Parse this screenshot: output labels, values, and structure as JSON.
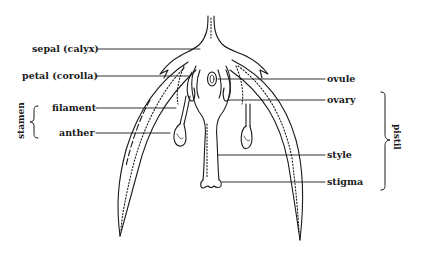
{
  "diagram": {
    "labels_left": [
      {
        "id": "sepal",
        "text": "sepal (calyx)"
      },
      {
        "id": "petal",
        "text": "petal (corolla)"
      },
      {
        "id": "filament",
        "text": "filament"
      },
      {
        "id": "anther",
        "text": "anther"
      }
    ],
    "labels_right": [
      {
        "id": "ovule",
        "text": "ovule"
      },
      {
        "id": "ovary",
        "text": "ovary"
      },
      {
        "id": "style",
        "text": "style"
      },
      {
        "id": "stigma",
        "text": "stigma"
      }
    ],
    "groups": {
      "stamen": {
        "text": "stamen",
        "members": [
          "filament",
          "anther"
        ]
      },
      "pistil": {
        "text": "pistil",
        "members": [
          "ovary",
          "style",
          "stigma"
        ]
      }
    },
    "colors": {
      "ink": "#1a1a1a",
      "background": "#ffffff"
    }
  }
}
